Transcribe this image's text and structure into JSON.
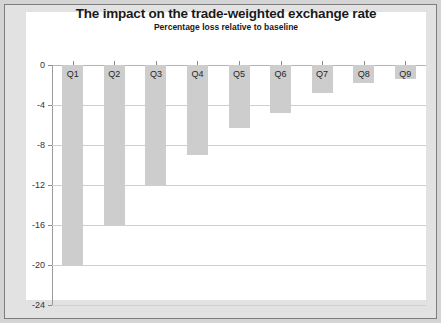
{
  "chart_data": {
    "type": "bar",
    "title": "The impact on the trade-weighted exchange rate",
    "subtitle": "Percentage loss relative to baseline",
    "xlabel": "",
    "ylabel": "",
    "categories": [
      "Q1",
      "Q2",
      "Q3",
      "Q4",
      "Q5",
      "Q6",
      "Q7",
      "Q8",
      "Q9"
    ],
    "values": [
      -20.0,
      -16.0,
      -12.0,
      -9.0,
      -6.3,
      -4.8,
      -2.8,
      -1.8,
      -1.4
    ],
    "ylim": [
      -24,
      0
    ],
    "yticks": [
      0,
      -4,
      -8,
      -12,
      -16,
      -20,
      -24
    ],
    "ytick_labels": [
      "0",
      "-4",
      "-8",
      "-12",
      "-16",
      "-20",
      "-24"
    ],
    "grid": true,
    "legend": "none",
    "bar_color": "#cdcdcd",
    "grid_color": "#cfcfcf",
    "axis_color": "#9a9a9a",
    "background": "#ffffff",
    "frame_color": "#d4d4d4"
  }
}
